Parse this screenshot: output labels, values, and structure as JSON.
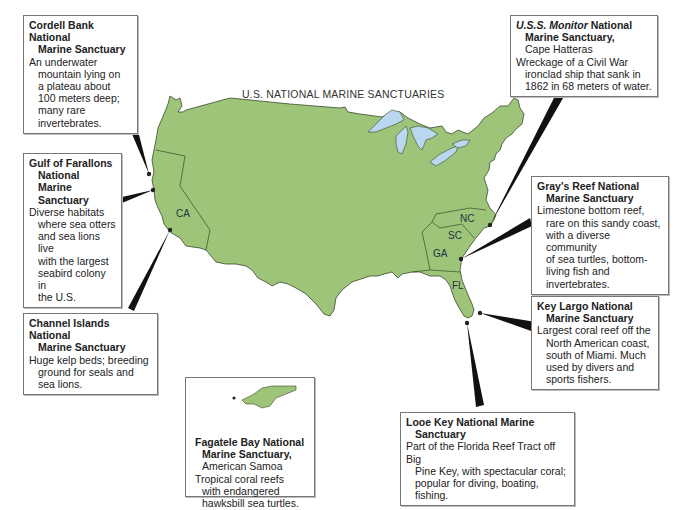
{
  "map": {
    "title": "U.S. NATIONAL MARINE SANCTUARIES",
    "land_color": "#9dc479",
    "water_color": "#b9d7ee",
    "states": [
      "CA",
      "NC",
      "SC",
      "GA",
      "FL"
    ]
  },
  "sanctuaries": {
    "cordell": {
      "title_1": "Cordell Bank National",
      "title_2": "Marine Sanctuary",
      "desc": [
        "An underwater",
        "mountain lying on",
        "a plateau about",
        "100 meters deep;",
        "many rare",
        "invertebrates."
      ]
    },
    "farallons": {
      "title_1": "Gulf of Farallons",
      "title_2": "National Marine",
      "title_3": "Sanctuary",
      "desc": [
        "Diverse habitats",
        "where sea otters",
        "and sea lions live",
        "with the largest",
        "seabird colony in",
        "the U.S."
      ]
    },
    "channel": {
      "title_1": "Channel Islands National",
      "title_2": "Marine Sanctuary",
      "desc": [
        "Huge kelp beds; breeding",
        "ground for seals and",
        "sea lions."
      ]
    },
    "fagatele": {
      "title_1": "Fagatele Bay National",
      "title_2": "Marine Sanctuary,",
      "subtitle": "American Samoa",
      "desc": [
        "Tropical coral reefs",
        "with endangered",
        "hawksbill sea turtles."
      ]
    },
    "looe": {
      "title_1": "Looe Key National Marine",
      "title_2": "Sanctuary",
      "desc": [
        "Part of the Florida Reef Tract off Big",
        "Pine Key, with spectacular coral;",
        "popular for diving, boating, fishing."
      ]
    },
    "keylargo": {
      "title_1": "Key Largo National",
      "title_2": "Marine Sanctuary",
      "desc": [
        "Largest coral reef off the",
        "North American coast,",
        "south of Miami.  Much",
        "used by divers and",
        "sports fishers."
      ]
    },
    "grays": {
      "title_1": "Gray's Reef National",
      "title_2": "Marine Sanctuary",
      "desc": [
        "Limestone bottom reef,",
        "rare on this sandy coast,",
        "with a diverse community",
        "of sea turtles, bottom-",
        "living fish and",
        "invertebrates."
      ]
    },
    "monitor": {
      "title_italic": "U.S.S. Monitor",
      "title_1_rest": " National",
      "title_2": "Marine Sanctuary,",
      "subtitle": "Cape Hatteras",
      "desc": [
        "Wreckage of a Civil War",
        "ironclad ship that sank in",
        "1862 in 68 meters of water."
      ]
    }
  }
}
